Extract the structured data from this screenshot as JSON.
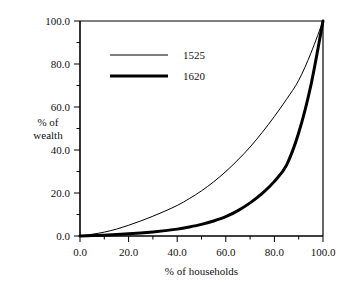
{
  "chart_data": {
    "type": "line",
    "title": "",
    "subtitle": "",
    "xlabel": "% of households",
    "ylabel": "% of\nwealth",
    "ylabel_line1": "% of",
    "ylabel_line2": "wealth",
    "xlim": [
      0.0,
      100.0
    ],
    "ylim": [
      0.0,
      100.0
    ],
    "xticks": [
      0.0,
      20.0,
      40.0,
      60.0,
      80.0,
      100.0
    ],
    "yticks": [
      0.0,
      20.0,
      40.0,
      60.0,
      80.0,
      100.0
    ],
    "xtick_labels": [
      "0.0",
      "20.0",
      "40.0",
      "60.0",
      "80.0",
      "100.0"
    ],
    "ytick_labels": [
      "0.0",
      "20.0",
      "40.0",
      "60.0",
      "80.0",
      "100.0"
    ],
    "minor_tick_interval": 10.0,
    "grid": false,
    "legend_position": "upper-left",
    "frame_color": "#000000",
    "series": [
      {
        "name": "1525",
        "color": "#000000",
        "line_width": 1,
        "x": [
          0,
          5,
          10,
          15,
          20,
          25,
          30,
          35,
          40,
          45,
          50,
          55,
          60,
          65,
          70,
          75,
          80,
          85,
          90,
          95,
          100
        ],
        "values": [
          0.0,
          0.8,
          1.8,
          3.2,
          5.0,
          7.0,
          9.2,
          11.6,
          14.2,
          17.4,
          21.0,
          25.2,
          30.0,
          35.4,
          41.4,
          48.2,
          55.6,
          63.6,
          72.4,
          85.0,
          100.0
        ]
      },
      {
        "name": "1620",
        "color": "#000000",
        "line_width": 3,
        "x": [
          0,
          5,
          10,
          15,
          20,
          25,
          30,
          35,
          40,
          45,
          50,
          55,
          60,
          65,
          70,
          75,
          80,
          85,
          90,
          95,
          100
        ],
        "values": [
          0.0,
          0.2,
          0.4,
          0.7,
          1.0,
          1.4,
          1.9,
          2.5,
          3.2,
          4.2,
          5.4,
          7.0,
          9.0,
          11.8,
          15.4,
          19.8,
          25.4,
          33.0,
          48.0,
          70.0,
          100.0
        ]
      }
    ]
  },
  "legend": {
    "entries": [
      {
        "label": "1525",
        "line_width": 1
      },
      {
        "label": "1620",
        "line_width": 3
      }
    ]
  },
  "axes": {
    "x_title": "% of households",
    "y_title_line1": "% of",
    "y_title_line2": "wealth"
  }
}
